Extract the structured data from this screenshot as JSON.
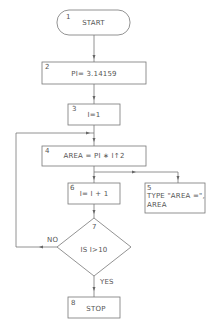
{
  "diagram": {
    "type": "flowchart",
    "line_color": "#777777",
    "nodes": [
      {
        "id": "1",
        "shape": "terminal",
        "number": "1",
        "text": "START"
      },
      {
        "id": "2",
        "shape": "process",
        "number": "2",
        "text": "PI= 3.14159"
      },
      {
        "id": "3",
        "shape": "process",
        "number": "3",
        "text": "I=1"
      },
      {
        "id": "4",
        "shape": "process",
        "number": "4",
        "text": "AREA = PI ∗ I↑2"
      },
      {
        "id": "5",
        "shape": "output",
        "number": "5",
        "text_line1": "TYPE \"AREA =\",",
        "text_line2": "AREA"
      },
      {
        "id": "6",
        "shape": "process",
        "number": "6",
        "text": "I= I + 1"
      },
      {
        "id": "7",
        "shape": "decision",
        "number": "7",
        "text": "IS I>10"
      },
      {
        "id": "8",
        "shape": "terminal-box",
        "number": "8",
        "text": "STOP"
      }
    ],
    "edges": [
      {
        "from": "1",
        "to": "2"
      },
      {
        "from": "2",
        "to": "3"
      },
      {
        "from": "3",
        "to": "4"
      },
      {
        "from": "4",
        "to": "6"
      },
      {
        "from": "4",
        "to": "5"
      },
      {
        "from": "6",
        "to": "7"
      },
      {
        "from": "7",
        "to": "4",
        "label": "NO"
      },
      {
        "from": "7",
        "to": "8",
        "label": "YES"
      }
    ],
    "labels": {
      "no": "NO",
      "yes": "YES"
    }
  }
}
